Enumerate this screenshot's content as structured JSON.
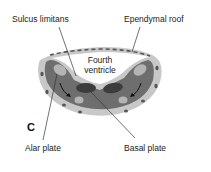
{
  "figure": {
    "panel_letter": "C",
    "labels": {
      "sulcus_limitans": "Sulcus limitans",
      "ependymal_roof": "Ependymal roof",
      "fourth_ventricle_line1": "Fourth",
      "fourth_ventricle_line2": "ventricle",
      "alar_plate": "Alar plate",
      "basal_plate": "Basal plate"
    },
    "colors": {
      "outer_layer": "#c8c8c8",
      "mantle": "#6e6e6e",
      "alar_nuclei": "#b4b4b4",
      "basal_nuclei": "#3c3c3c",
      "roof_dash": "#555555",
      "leader_line": "#333333"
    }
  }
}
